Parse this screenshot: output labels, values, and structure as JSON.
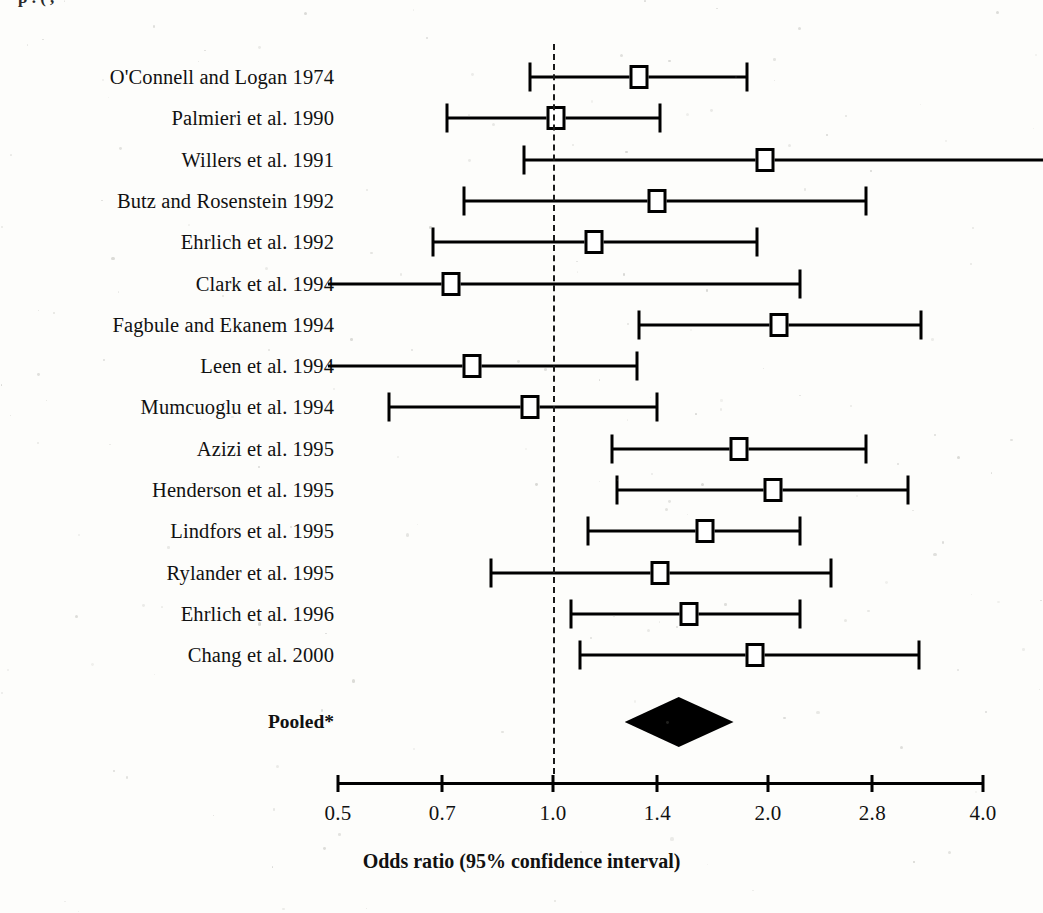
{
  "figure": {
    "clipped_title": "p      .   (            ,",
    "axis_title": "Odds ratio (95% confidence interval)",
    "pooled_label": "Pooled*",
    "marker_color": "#000000",
    "background": "#fdfdfb"
  },
  "chart_data": {
    "type": "forest",
    "title": "",
    "xlabel": "Odds ratio (95% confidence interval)",
    "ylabel": "",
    "scale": "log",
    "xlim": [
      0.5,
      4.0
    ],
    "tick_values": [
      0.5,
      0.7,
      1.0,
      1.4,
      2.0,
      2.8,
      4.0
    ],
    "tick_labels": [
      "0.5",
      "0.7",
      "1.0",
      "1.4",
      "2.0",
      "2.8",
      "4.0"
    ],
    "null_value": 1.0,
    "grid": false,
    "legend": "none",
    "categories": [
      "O'Connell and Logan 1974",
      "Palmieri et al. 1990",
      "Willers et al. 1991",
      "Butz and Rosenstein 1992",
      "Ehrlich et al. 1992",
      "Clark et al. 1994",
      "Fagbule and Ekanem 1994",
      "Leen et al. 1994",
      "Mumcuoglu et al. 1994",
      "Azizi et al. 1995",
      "Henderson et al. 1995",
      "Lindfors et al. 1995",
      "Rylander et al. 1995",
      "Ehrlich et al. 1996",
      "Chang et al. 2000"
    ],
    "studies": [
      {
        "label": "O'Connell and Logan 1974",
        "or": 1.32,
        "lcl": 0.93,
        "ucl": 1.87,
        "lcl_clipped": false,
        "ucl_clipped": false
      },
      {
        "label": "Palmieri et al. 1990",
        "or": 1.01,
        "lcl": 0.71,
        "ucl": 1.41,
        "lcl_clipped": false,
        "ucl_clipped": false
      },
      {
        "label": "Willers et al. 1991",
        "or": 1.98,
        "lcl": 0.91,
        "ucl": 4.6,
        "lcl_clipped": false,
        "ucl_clipped": true
      },
      {
        "label": "Butz and Rosenstein 1992",
        "or": 1.4,
        "lcl": 0.75,
        "ucl": 2.74,
        "lcl_clipped": false,
        "ucl_clipped": false
      },
      {
        "label": "Ehrlich et al. 1992",
        "or": 1.14,
        "lcl": 0.68,
        "ucl": 1.93,
        "lcl_clipped": false,
        "ucl_clipped": false
      },
      {
        "label": "Clark et al. 1994",
        "or": 0.72,
        "lcl": 0.42,
        "ucl": 2.22,
        "lcl_clipped": true,
        "ucl_clipped": false
      },
      {
        "label": "Fagbule and Ekanem 1994",
        "or": 2.07,
        "lcl": 1.32,
        "ucl": 3.28,
        "lcl_clipped": false,
        "ucl_clipped": false
      },
      {
        "label": "Leen et al. 1994",
        "or": 0.77,
        "lcl": 0.42,
        "ucl": 1.31,
        "lcl_clipped": true,
        "ucl_clipped": false
      },
      {
        "label": "Mumcuoglu et al. 1994",
        "or": 0.93,
        "lcl": 0.59,
        "ucl": 1.4,
        "lcl_clipped": false,
        "ucl_clipped": false
      },
      {
        "label": "Azizi et al. 1995",
        "or": 1.82,
        "lcl": 1.21,
        "ucl": 2.74,
        "lcl_clipped": false,
        "ucl_clipped": false
      },
      {
        "label": "Henderson et al. 1995",
        "or": 2.03,
        "lcl": 1.23,
        "ucl": 3.14,
        "lcl_clipped": false,
        "ucl_clipped": false
      },
      {
        "label": "Lindfors et al. 1995",
        "or": 1.63,
        "lcl": 1.12,
        "ucl": 2.22,
        "lcl_clipped": false,
        "ucl_clipped": false
      },
      {
        "label": "Rylander et al. 1995",
        "or": 1.41,
        "lcl": 0.82,
        "ucl": 2.45,
        "lcl_clipped": false,
        "ucl_clipped": false
      },
      {
        "label": "Ehrlich et al. 1996",
        "or": 1.55,
        "lcl": 1.06,
        "ucl": 2.22,
        "lcl_clipped": false,
        "ucl_clipped": false
      },
      {
        "label": "Chang et al. 2000",
        "or": 1.92,
        "lcl": 1.09,
        "ucl": 3.25,
        "lcl_clipped": false,
        "ucl_clipped": false
      }
    ],
    "pooled": {
      "label": "Pooled*",
      "or": 1.5,
      "lcl": 1.26,
      "ucl": 1.79,
      "shape": "diamond"
    }
  },
  "layout": {
    "axis_x_left_px": 338,
    "axis_x_right_px": 983,
    "first_row_y_px": 77,
    "row_step_px": 41.3,
    "pooled_y_px": 722,
    "axis_y_px": 782,
    "label_col_right_px": 334
  }
}
